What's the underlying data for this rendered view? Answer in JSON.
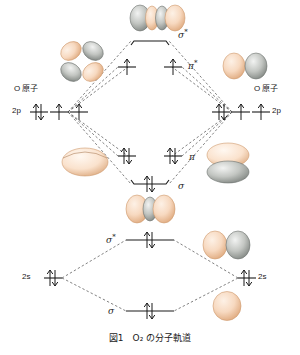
{
  "figure": {
    "caption_prefix": "図1",
    "caption_text": "O₂ の分子軌道",
    "caption_full": "図1　O₂ の分子軌道"
  },
  "colors": {
    "peach": "#f6d5bb",
    "peach_dark": "#d9a477",
    "gray": "#b9bcb8",
    "gray_dark": "#7e8480",
    "line": "#1a1a1a",
    "dashed": "#555555",
    "background": "#ffffff"
  },
  "atoms": {
    "left": {
      "atom_label": "O 原子",
      "p_label": "2p",
      "s_label": "2s",
      "p_occupancy": [
        "pair",
        "single",
        "single"
      ],
      "s_occupancy": [
        "pair"
      ]
    },
    "right": {
      "atom_label": "O 原子",
      "p_label": "2p",
      "s_label": "2s",
      "p_occupancy": [
        "pair",
        "single",
        "single"
      ],
      "s_occupancy": [
        "pair"
      ]
    }
  },
  "molecular_orbitals": [
    {
      "id": "sigma-star-2p",
      "label": "σ",
      "star": "*",
      "level": "antibonding",
      "shell": "2p",
      "electrons": [],
      "occupancy": []
    },
    {
      "id": "pi-star-2p",
      "label": "π",
      "star": "*",
      "level": "antibonding",
      "shell": "2p",
      "electrons": [
        "single",
        "single"
      ],
      "occupancy": [
        "single",
        "single"
      ]
    },
    {
      "id": "pi-2p",
      "label": "π",
      "star": "",
      "level": "bonding",
      "shell": "2p",
      "electrons": [
        "pair",
        "pair"
      ],
      "occupancy": [
        "pair",
        "pair"
      ]
    },
    {
      "id": "sigma-2p",
      "label": "σ",
      "star": "",
      "level": "bonding",
      "shell": "2p",
      "electrons": [
        "pair"
      ],
      "occupancy": [
        "pair"
      ]
    },
    {
      "id": "sigma-star-2s",
      "label": "σ",
      "star": "*",
      "level": "antibonding",
      "shell": "2s",
      "electrons": [
        "pair"
      ],
      "occupancy": [
        "pair"
      ]
    },
    {
      "id": "sigma-2s",
      "label": "σ",
      "star": "",
      "level": "bonding",
      "shell": "2s",
      "electrons": [
        "pair"
      ],
      "occupancy": [
        "pair"
      ]
    }
  ],
  "orbital_pictures": [
    {
      "id": "sigma-star-2p-picture",
      "name": "sigma-star-2p-orbital-lobes",
      "lobes": "gray-peach-gray-peach"
    },
    {
      "id": "left-2p-picture",
      "name": "p-orbital-four-lobes",
      "lobes": "peach-gray-gray-peach"
    },
    {
      "id": "right-pi-star-picture",
      "name": "pi-star-orbital-two-lobes",
      "lobes": "peach-gray"
    },
    {
      "id": "left-pi-picture",
      "name": "pi-orbital-disc",
      "lobes": "peach"
    },
    {
      "id": "right-pi-picture",
      "name": "pi-orbital-stacked-discs",
      "lobes": "peach-gray"
    },
    {
      "id": "sigma-2p-picture",
      "name": "sigma-2p-orbital-lobes",
      "lobes": "peach-gray-peach"
    },
    {
      "id": "sigma-star-2s-picture",
      "name": "sigma-star-2s-orbital-lobes",
      "lobes": "peach-gray"
    },
    {
      "id": "sigma-2s-picture",
      "name": "sigma-2s-orbital-sphere",
      "lobes": "peach"
    }
  ]
}
